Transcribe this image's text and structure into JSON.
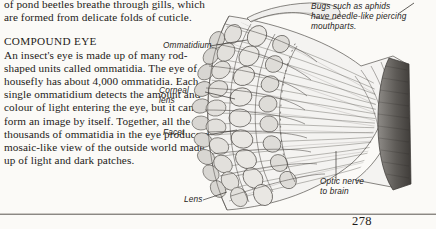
{
  "page": {
    "folio": "278",
    "background_color": "#fbfaf7",
    "text_color": "#1d1a17"
  },
  "body": {
    "continued_paragraph": "of pond beetles breathe through gills, which are formed from delicate folds of cuticle.",
    "heading": "COMPOUND EYE",
    "paragraph": "An insect's eye is made up of many rod-shaped units called ommatidia. The eye of a housefly has about 4,000 ommatidia. Each single ommatidium detects the amount and colour of light entering the eye, but it cannot form an image by itself. Together, all the thousands of ommatidia in the eye produce a mosaic-like view of the outside world made up of light and dark patches."
  },
  "captions": {
    "aphid": "Bugs such as aphids\nhave needle-like piercing\nmouthparts."
  },
  "diagram": {
    "name": "compound-eye-cutaway",
    "labels": [
      {
        "id": "ommatidium",
        "text": "Ommatidium"
      },
      {
        "id": "corneal-lens",
        "text": "Corneal\nlens"
      },
      {
        "id": "facet",
        "text": "Facet"
      },
      {
        "id": "lens",
        "text": "Lens"
      },
      {
        "id": "optic-nerve",
        "text": "Optic nerve\nto brain"
      }
    ],
    "ink_color": "#4e4b47",
    "shade_color": "#d8d6d2"
  }
}
